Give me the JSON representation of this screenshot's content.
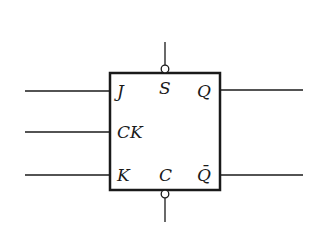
{
  "diagram": {
    "inputs": [
      {
        "label": "J"
      },
      {
        "label": "CK"
      },
      {
        "label": "K"
      }
    ],
    "outputs": [
      {
        "label": "Q"
      },
      {
        "label": "Q̄"
      }
    ],
    "top_pin": {
      "label": "S"
    },
    "bottom_pin": {
      "label": "C"
    },
    "colors": {
      "stroke": "#1a1a1a",
      "background": "#ffffff"
    }
  }
}
